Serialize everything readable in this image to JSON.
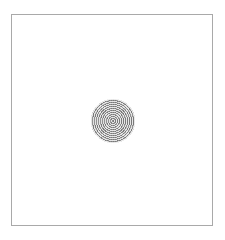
{
  "figure": {
    "frame": {
      "border_color": "#a9a9a9",
      "background_color": "#ffffff"
    },
    "stimulus": {
      "shape": "concentric-ring-disc",
      "center": [
        112.5,
        120.5
      ],
      "radius": 22,
      "ring_dark_color": "#7a7a7a",
      "ring_light_color": "#e2e2e2",
      "ring_period_px": 2
    }
  }
}
